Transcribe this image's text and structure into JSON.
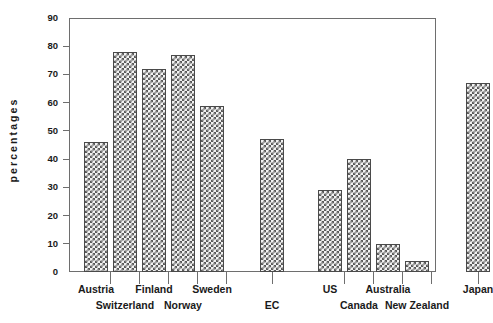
{
  "chart_data": {
    "type": "bar",
    "title": "",
    "subtitle": "",
    "xlabel": "",
    "ylabel": "percentages",
    "ylim": [
      0,
      90
    ],
    "yticks": [
      0,
      10,
      20,
      30,
      40,
      50,
      60,
      70,
      80,
      90
    ],
    "ytick_labels": [
      "0",
      "10",
      "20",
      "30",
      "40",
      "50",
      "60",
      "70",
      "80",
      "90"
    ],
    "grid": false,
    "legend": "none",
    "bar_style": "checkerboard-hatch",
    "categories": [
      "Austria",
      "Switzerland",
      "Finland",
      "Norway",
      "Sweden",
      "EC",
      "US",
      "Canada",
      "Australia",
      "New Zealand",
      "Japan"
    ],
    "values": [
      46,
      78,
      72,
      77,
      59,
      47,
      29,
      40,
      10,
      4,
      67
    ],
    "groups": [
      {
        "name": "EFTA/Nordic",
        "categories": [
          "Austria",
          "Switzerland",
          "Finland",
          "Norway",
          "Sweden"
        ]
      },
      {
        "name": "EC",
        "categories": [
          "EC"
        ]
      },
      {
        "name": "Other OECD",
        "categories": [
          "US",
          "Canada",
          "Australia",
          "New Zealand"
        ]
      },
      {
        "name": "Japan",
        "categories": [
          "Japan"
        ]
      }
    ]
  },
  "axis": {
    "y_title": "percentages",
    "tick_labels": {
      "t90": "90",
      "t80": "80",
      "t70": "70",
      "t60": "60",
      "t50": "50",
      "t40": "40",
      "t30": "30",
      "t20": "20",
      "t10": "10",
      "t0": "0"
    }
  },
  "x_labels": {
    "row1": [
      "Austria",
      "Finland",
      "Sweden",
      "US",
      "Australia",
      "Japan"
    ],
    "row2": [
      "Switzerland",
      "Norway",
      "EC",
      "Canada",
      "New Zealand"
    ]
  },
  "colors": {
    "bar_fill": "#f2f2f2",
    "bar_hatch": "#5a5a5a",
    "bar_border": "#4a4a4a",
    "axis": "#6e6e6e",
    "text": "#1a1a1a",
    "background": "#ffffff"
  }
}
